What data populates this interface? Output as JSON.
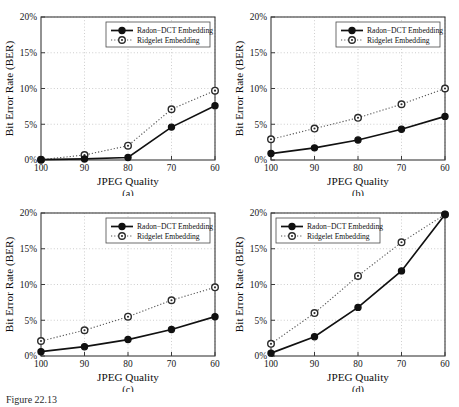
{
  "figure": {
    "caption_prefix": "Figure",
    "caption_number": "22.13",
    "caption_text": "Figure  22.13"
  },
  "axes": {
    "xlabel": "JPEG Quality",
    "ylabel": "Bit Error Rate (BER)",
    "xticks": [
      "100",
      "90",
      "80",
      "70",
      "60"
    ],
    "yticks": [
      "0%",
      "5%",
      "10%",
      "15%",
      "20%"
    ]
  },
  "legend": {
    "series_1": "Radon−DCT Embedding",
    "series_2": "Ridgelet Embedding"
  },
  "panels": {
    "a": {
      "label": "(a)"
    },
    "b": {
      "label": "(b)"
    },
    "c": {
      "label": "(c)"
    },
    "d": {
      "label": "(d)"
    }
  },
  "chart_data": [
    {
      "type": "line",
      "panel": "(a)",
      "title": "",
      "xlabel": "JPEG Quality",
      "ylabel": "Bit Error Rate (BER)",
      "x": [
        100,
        90,
        80,
        70,
        60
      ],
      "xtick_labels": [
        "100",
        "90",
        "80",
        "70",
        "60"
      ],
      "xlim": [
        100,
        60
      ],
      "ylim": [
        0,
        20
      ],
      "ytick_labels": [
        "0%",
        "5%",
        "10%",
        "15%",
        "20%"
      ],
      "yticks": [
        0,
        5,
        10,
        15,
        20
      ],
      "grid": true,
      "legend_position": "top-right",
      "series": [
        {
          "name": "Radon−DCT Embedding",
          "style": "solid",
          "marker": "filled-circle",
          "values": [
            0.05,
            0.15,
            0.35,
            4.6,
            7.6
          ]
        },
        {
          "name": "Ridgelet Embedding",
          "style": "dotted",
          "marker": "open-circle",
          "values": [
            0.05,
            0.7,
            2.0,
            7.1,
            9.7
          ]
        }
      ]
    },
    {
      "type": "line",
      "panel": "(b)",
      "title": "",
      "xlabel": "JPEG Quality",
      "ylabel": "Bit Error Rate (BER)",
      "x": [
        100,
        90,
        80,
        70,
        60
      ],
      "xtick_labels": [
        "100",
        "90",
        "80",
        "70",
        "60"
      ],
      "xlim": [
        100,
        60
      ],
      "ylim": [
        0,
        20
      ],
      "ytick_labels": [
        "0%",
        "5%",
        "10%",
        "15%",
        "20%"
      ],
      "yticks": [
        0,
        5,
        10,
        15,
        20
      ],
      "grid": true,
      "legend_position": "top-right",
      "series": [
        {
          "name": "Radon−DCT Embedding",
          "style": "solid",
          "marker": "filled-circle",
          "values": [
            0.9,
            1.7,
            2.8,
            4.3,
            6.1
          ]
        },
        {
          "name": "Ridgelet Embedding",
          "style": "dotted",
          "marker": "open-circle",
          "values": [
            2.9,
            4.4,
            5.9,
            7.8,
            10.0
          ]
        }
      ]
    },
    {
      "type": "line",
      "panel": "(c)",
      "title": "",
      "xlabel": "JPEG Quality",
      "ylabel": "Bit Error Rate (BER)",
      "x": [
        100,
        90,
        80,
        70,
        60
      ],
      "xtick_labels": [
        "100",
        "90",
        "80",
        "70",
        "60"
      ],
      "xlim": [
        100,
        60
      ],
      "ylim": [
        0,
        20
      ],
      "ytick_labels": [
        "0%",
        "5%",
        "10%",
        "15%",
        "20%"
      ],
      "yticks": [
        0,
        5,
        10,
        15,
        20
      ],
      "grid": true,
      "legend_position": "top-right",
      "series": [
        {
          "name": "Radon−DCT Embedding",
          "style": "solid",
          "marker": "filled-circle",
          "values": [
            0.6,
            1.3,
            2.3,
            3.7,
            5.5
          ]
        },
        {
          "name": "Ridgelet Embedding",
          "style": "dotted",
          "marker": "open-circle",
          "values": [
            2.1,
            3.6,
            5.5,
            7.8,
            9.6
          ]
        }
      ]
    },
    {
      "type": "line",
      "panel": "(d)",
      "title": "",
      "xlabel": "JPEG Quality",
      "ylabel": "Bit Error Rate (BER)",
      "x": [
        100,
        90,
        80,
        70,
        60
      ],
      "xtick_labels": [
        "100",
        "90",
        "80",
        "70",
        "60"
      ],
      "xlim": [
        100,
        60
      ],
      "ylim": [
        0,
        20
      ],
      "ytick_labels": [
        "0%",
        "5%",
        "10%",
        "15%",
        "20%"
      ],
      "yticks": [
        0,
        5,
        10,
        15,
        20
      ],
      "grid": true,
      "legend_position": "top-left",
      "series": [
        {
          "name": "Radon−DCT Embedding",
          "style": "solid",
          "marker": "filled-circle",
          "values": [
            0.4,
            2.7,
            6.8,
            11.9,
            19.8
          ]
        },
        {
          "name": "Ridgelet Embedding",
          "style": "dotted",
          "marker": "open-circle",
          "values": [
            1.7,
            6.0,
            11.2,
            15.9,
            19.8
          ]
        }
      ]
    }
  ]
}
